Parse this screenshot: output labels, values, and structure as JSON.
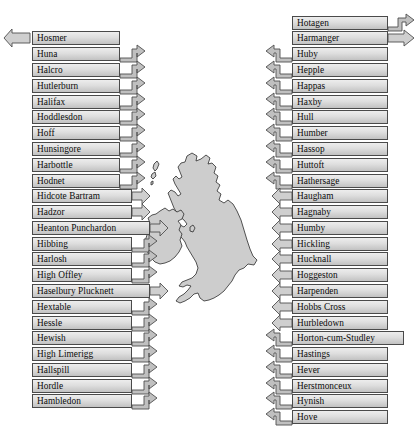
{
  "figure": {
    "kind": "annotated-map-diagram",
    "map_name": "british-isles",
    "background": "#ffffff",
    "label_fill_top": "#ededed",
    "label_fill_bottom": "#c2c2c2",
    "label_border": "#4a4a4a",
    "arrow_fill": "#cfcfcf",
    "arrow_border": "#4f4f4f",
    "map_fill": "#cdcdcd",
    "map_border": "#2b2b2b"
  },
  "left_column": {
    "name": "left-label-column",
    "count": 23,
    "items": [
      {
        "label": "Hosmer",
        "y": 37,
        "w": 88,
        "arrow": "left-out"
      },
      {
        "label": "Huna",
        "y": 53,
        "w": 88,
        "arrow": "right-hook"
      },
      {
        "label": "Halcro",
        "y": 69,
        "w": 88,
        "arrow": "right-hook"
      },
      {
        "label": "Hutlerburn",
        "y": 85,
        "w": 88,
        "arrow": "right-hook"
      },
      {
        "label": "Halifax",
        "y": 101,
        "w": 88,
        "arrow": "right-hook"
      },
      {
        "label": "Hoddlesdon",
        "y": 117,
        "w": 88,
        "arrow": "right-hook"
      },
      {
        "label": "Hoff",
        "y": 133,
        "w": 88,
        "arrow": "right-hook"
      },
      {
        "label": "Hunsingore",
        "y": 149,
        "w": 88,
        "arrow": "right-hook"
      },
      {
        "label": "Harbottle",
        "y": 165,
        "w": 88,
        "arrow": "right-hook"
      },
      {
        "label": "Hodnet",
        "y": 181,
        "w": 88,
        "arrow": "right-hook"
      },
      {
        "label": "Hidcote Bartram",
        "y": 197,
        "w": 100,
        "arrow": "right-flat"
      },
      {
        "label": "Hadzor",
        "y": 213,
        "w": 100,
        "arrow": "right-flat"
      },
      {
        "label": "Heanton Punchardon",
        "y": 229,
        "w": 118,
        "arrow": "right-flat"
      },
      {
        "label": "Hibbing",
        "y": 245,
        "w": 100,
        "arrow": "right-hook"
      },
      {
        "label": "Harlosh",
        "y": 261,
        "w": 100,
        "arrow": "right-hook"
      },
      {
        "label": "High Offley",
        "y": 277,
        "w": 100,
        "arrow": "right-hook"
      },
      {
        "label": "Haselbury Plucknett",
        "y": 293,
        "w": 118,
        "arrow": "right-flat"
      },
      {
        "label": "Hextable",
        "y": 309,
        "w": 100,
        "arrow": "right-hook"
      },
      {
        "label": "Hessle",
        "y": 325,
        "w": 100,
        "arrow": "right-hook"
      },
      {
        "label": "Hewish",
        "y": 341,
        "w": 100,
        "arrow": "right-hook"
      },
      {
        "label": "High Limerigg",
        "y": 357,
        "w": 100,
        "arrow": "right-hook"
      },
      {
        "label": "Hallspill",
        "y": 373,
        "w": 100,
        "arrow": "right-hook"
      },
      {
        "label": "Hordle",
        "y": 389,
        "w": 100,
        "arrow": "right-hook"
      },
      {
        "label": "Hambledon",
        "y": 405,
        "w": 100,
        "arrow": "right-hook"
      },
      {
        "label": "Hugglescote",
        "y": 421,
        "w": 100,
        "arrow": "right-hook"
      }
    ]
  },
  "right_column": {
    "name": "right-label-column",
    "count": 27,
    "items": [
      {
        "label": "Hotagen",
        "y": 21,
        "arrow": "right-out-hook"
      },
      {
        "label": "Harmanger",
        "y": 37,
        "arrow": "right-out-flat"
      },
      {
        "label": "Huby",
        "y": 53,
        "arrow": "left-hook"
      },
      {
        "label": "Hepple",
        "y": 69,
        "arrow": "left-hook"
      },
      {
        "label": "Happas",
        "y": 85,
        "arrow": "left-hook"
      },
      {
        "label": "Haxby",
        "y": 101,
        "arrow": "left-hook"
      },
      {
        "label": "Hull",
        "y": 117,
        "arrow": "left-hook"
      },
      {
        "label": "Humber",
        "y": 133,
        "arrow": "left-hook"
      },
      {
        "label": "Hassop",
        "y": 149,
        "arrow": "left-hook"
      },
      {
        "label": "Huttoft",
        "y": 165,
        "arrow": "left-hook"
      },
      {
        "label": "Hathersage",
        "y": 181,
        "arrow": "left-hook"
      },
      {
        "label": "Haugham",
        "y": 197,
        "arrow": "left-flat"
      },
      {
        "label": "Hagnaby",
        "y": 213,
        "arrow": "left-flat"
      },
      {
        "label": "Humby",
        "y": 229,
        "arrow": "left-flat"
      },
      {
        "label": "Hickling",
        "y": 245,
        "arrow": "left-flat"
      },
      {
        "label": "Hucknall",
        "y": 261,
        "arrow": "left-flat"
      },
      {
        "label": "Hoggeston",
        "y": 277,
        "arrow": "left-flat"
      },
      {
        "label": "Harpenden",
        "y": 293,
        "arrow": "left-flat"
      },
      {
        "label": "Hobbs Cross",
        "y": 309,
        "arrow": "left-flat"
      },
      {
        "label": "Hurbledown",
        "y": 325,
        "arrow": "left-flat"
      },
      {
        "label": "Horton-cum-Studley",
        "y": 341,
        "arrow": "left-hook"
      },
      {
        "label": "Hastings",
        "y": 357,
        "arrow": "left-hook"
      },
      {
        "label": "Hever",
        "y": 373,
        "arrow": "left-hook"
      },
      {
        "label": "Herstmonceux",
        "y": 389,
        "arrow": "left-hook"
      },
      {
        "label": "Hynish",
        "y": 405,
        "arrow": "left-hook"
      },
      {
        "label": "Hove",
        "y": 421,
        "arrow": "left-hook"
      },
      {
        "label": "Hankate",
        "y": 437,
        "arrow": "right-out-flat"
      }
    ]
  }
}
